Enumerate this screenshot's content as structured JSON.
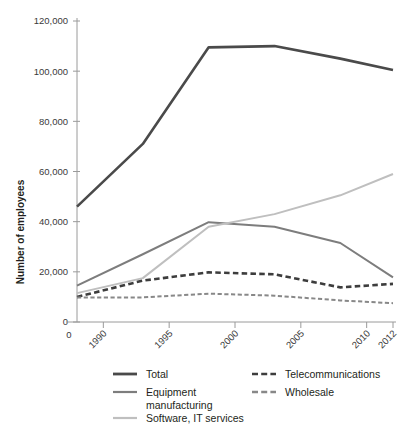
{
  "chart_data": {
    "type": "line",
    "title": "",
    "subtitle": "",
    "xlabel": "",
    "ylabel": "Number of employees",
    "grid": false,
    "legend_position": "bottom",
    "xlim": [
      1988,
      2012
    ],
    "ylim": [
      0,
      120000
    ],
    "x_tick_labels": [
      "0",
      "1990",
      "1995",
      "2000",
      "2005",
      "2010",
      "2012"
    ],
    "x_tick_values": [
      null,
      1990,
      1995,
      2000,
      2005,
      2010,
      2012
    ],
    "y_tick_labels": [
      "0",
      "20,000",
      "40,000",
      "60,000",
      "80,000",
      "100,000",
      "120,000"
    ],
    "y_tick_values": [
      0,
      20000,
      40000,
      60000,
      80000,
      100000,
      120000
    ],
    "x": [
      1988,
      1993,
      1998,
      2003,
      2008,
      2012
    ],
    "series": [
      {
        "name": "Total",
        "color": "#4a4a4a",
        "style": "solid",
        "width": 2.6,
        "values": [
          46000,
          71000,
          109500,
          110000,
          105000,
          100500
        ]
      },
      {
        "name": "Equipment manufacturing",
        "color": "#7d7d7d",
        "style": "solid",
        "width": 2.0,
        "values": [
          14500,
          27000,
          39800,
          38000,
          31500,
          17800
        ]
      },
      {
        "name": "Software, IT services",
        "color": "#bfbfbf",
        "style": "solid",
        "width": 2.0,
        "values": [
          11500,
          17500,
          38000,
          43000,
          50500,
          59000
        ]
      },
      {
        "name": "Telecommunications",
        "color": "#3d3d3d",
        "style": "dashed",
        "width": 2.6,
        "values": [
          10000,
          16500,
          19800,
          19000,
          13800,
          15200
        ]
      },
      {
        "name": "Wholesale",
        "color": "#888888",
        "style": "dashed",
        "width": 2.0,
        "values": [
          9800,
          9800,
          11300,
          10500,
          8600,
          7500
        ]
      }
    ]
  },
  "axis": {
    "y_title": "Number of employees"
  },
  "legend": {
    "entries": [
      {
        "label": "Total",
        "color": "#4a4a4a",
        "style": "solid",
        "column": 1,
        "row": 1
      },
      {
        "label": "Equipment",
        "label2": "manufacturing",
        "color": "#7d7d7d",
        "style": "solid",
        "column": 1,
        "row": 2
      },
      {
        "label": "Software, IT services",
        "color": "#bfbfbf",
        "style": "solid",
        "column": 1,
        "row": 3
      },
      {
        "label": "Telecommunications",
        "color": "#3d3d3d",
        "style": "dashed",
        "column": 2,
        "row": 1
      },
      {
        "label": "Wholesale",
        "color": "#888888",
        "style": "dashed",
        "column": 2,
        "row": 2
      }
    ]
  },
  "colors": {
    "total": "#4a4a4a",
    "equipment": "#7d7d7d",
    "software": "#bfbfbf",
    "telecom": "#3d3d3d",
    "wholesale": "#888888",
    "axis": "#9a9a9a",
    "text": "#231f20"
  }
}
